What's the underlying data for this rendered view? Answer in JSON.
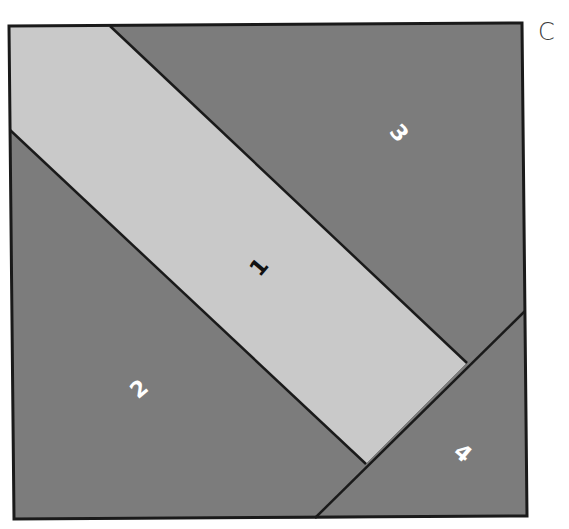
{
  "panel_label": "C",
  "colors": {
    "light": "#c9c9c9",
    "dark": "#7c7c7c",
    "outline": "#1a1a1a",
    "label_on_light": "#111111",
    "label_on_dark": "#ffffff"
  },
  "square": {
    "corners": [
      [
        9,
        26
      ],
      [
        522,
        23
      ],
      [
        527,
        516
      ],
      [
        14,
        519
      ]
    ]
  },
  "pieces": [
    {
      "id": "1",
      "label": "1",
      "shade": "light",
      "points": [
        [
          9,
          26
        ],
        [
          110,
          26
        ],
        [
          467,
          363
        ],
        [
          366,
          464
        ],
        [
          10,
          130
        ]
      ],
      "label_pos": [
        260,
        268
      ],
      "label_rotation": -50
    },
    {
      "id": "2",
      "label": "2",
      "shade": "dark",
      "points": [
        [
          10,
          130
        ],
        [
          366,
          464
        ],
        [
          315,
          518
        ],
        [
          14,
          519
        ]
      ],
      "label_pos": [
        140,
        390
      ],
      "label_rotation": -40
    },
    {
      "id": "3",
      "label": "3",
      "shade": "dark",
      "points": [
        [
          110,
          26
        ],
        [
          522,
          23
        ],
        [
          525,
          311
        ],
        [
          467,
          363
        ]
      ],
      "label_pos": [
        398,
        134
      ],
      "label_rotation": 50
    },
    {
      "id": "4",
      "label": "4",
      "shade": "dark",
      "points": [
        [
          525,
          311
        ],
        [
          527,
          516
        ],
        [
          315,
          518
        ],
        [
          366,
          464
        ],
        [
          467,
          363
        ]
      ],
      "label_pos": [
        462,
        454
      ],
      "label_rotation": 40
    }
  ],
  "seams": [
    [
      [
        110,
        26
      ],
      [
        467,
        363
      ]
    ],
    [
      [
        10,
        130
      ],
      [
        366,
        464
      ]
    ],
    [
      [
        525,
        311
      ],
      [
        315,
        518
      ]
    ]
  ]
}
